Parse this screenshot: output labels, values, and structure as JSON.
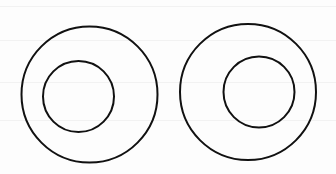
{
  "figure": {
    "width": 336,
    "height": 174,
    "background": "#fdfdfd",
    "stroke_color": "#111111",
    "stroke_width": 2,
    "shapes": [
      {
        "name": "left-pair",
        "outer": {
          "cx": 89.5,
          "cy": 94.5,
          "r": 68
        },
        "inner": {
          "cx": 78.5,
          "cy": 96.5,
          "r": 35.5
        }
      },
      {
        "name": "right-pair",
        "outer": {
          "cx": 248,
          "cy": 92,
          "r": 68
        },
        "inner": {
          "cx": 259,
          "cy": 92,
          "r": 35.5
        }
      }
    ],
    "scanlines_y": [
      6,
      40,
      82,
      120
    ]
  }
}
